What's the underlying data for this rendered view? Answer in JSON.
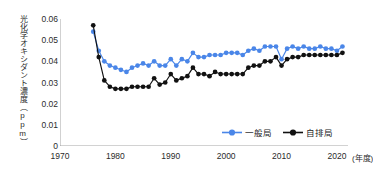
{
  "chart_data": {
    "type": "line",
    "title": "",
    "xlabel": "年度",
    "ylabel": "光化学オキシダント濃度（ppm）",
    "xlim": [
      1970,
      2022
    ],
    "ylim": [
      0,
      0.06
    ],
    "xticks": [
      1970,
      1980,
      1990,
      2000,
      2010,
      2020
    ],
    "yticks": [
      "0",
      "0.01",
      "0.02",
      "0.03",
      "0.04",
      "0.05",
      "0.06"
    ],
    "ytick_values": [
      0,
      0.01,
      0.02,
      0.03,
      0.04,
      0.05,
      0.06
    ],
    "grid": false,
    "legend_position": "inside-lower-right",
    "x": [
      1976,
      1977,
      1978,
      1979,
      1980,
      1981,
      1982,
      1983,
      1984,
      1985,
      1986,
      1987,
      1988,
      1989,
      1990,
      1991,
      1992,
      1993,
      1994,
      1995,
      1996,
      1997,
      1998,
      1999,
      2000,
      2001,
      2002,
      2003,
      2004,
      2005,
      2006,
      2007,
      2008,
      2009,
      2010,
      2011,
      2012,
      2013,
      2014,
      2015,
      2016,
      2017,
      2018,
      2019,
      2020,
      2021
    ],
    "series": [
      {
        "name": "一般局",
        "color": "#4A86E8",
        "marker": "circle",
        "values": [
          0.054,
          0.045,
          0.04,
          0.038,
          0.037,
          0.036,
          0.035,
          0.037,
          0.038,
          0.039,
          0.038,
          0.04,
          0.038,
          0.038,
          0.041,
          0.038,
          0.041,
          0.04,
          0.044,
          0.042,
          0.042,
          0.043,
          0.043,
          0.043,
          0.044,
          0.044,
          0.044,
          0.043,
          0.045,
          0.046,
          0.045,
          0.047,
          0.047,
          0.047,
          0.041,
          0.046,
          0.047,
          0.046,
          0.047,
          0.046,
          0.046,
          0.047,
          0.046,
          0.046,
          0.045,
          0.047
        ]
      },
      {
        "name": "自排局",
        "color": "#111111",
        "marker": "circle",
        "values": [
          0.057,
          0.042,
          0.031,
          0.028,
          0.027,
          0.027,
          0.027,
          0.028,
          0.028,
          0.028,
          0.028,
          0.032,
          0.029,
          0.03,
          0.034,
          0.031,
          0.032,
          0.033,
          0.037,
          0.034,
          0.034,
          0.033,
          0.035,
          0.034,
          0.034,
          0.034,
          0.034,
          0.034,
          0.037,
          0.038,
          0.038,
          0.04,
          0.04,
          0.042,
          0.038,
          0.041,
          0.042,
          0.042,
          0.043,
          0.043,
          0.043,
          0.043,
          0.043,
          0.043,
          0.043,
          0.044
        ]
      }
    ]
  },
  "legend": {
    "items": [
      {
        "label": "一般局",
        "color": "#4A86E8"
      },
      {
        "label": "自排局",
        "color": "#111111"
      }
    ]
  },
  "axis": {
    "x_unit_label": "(年度)"
  }
}
